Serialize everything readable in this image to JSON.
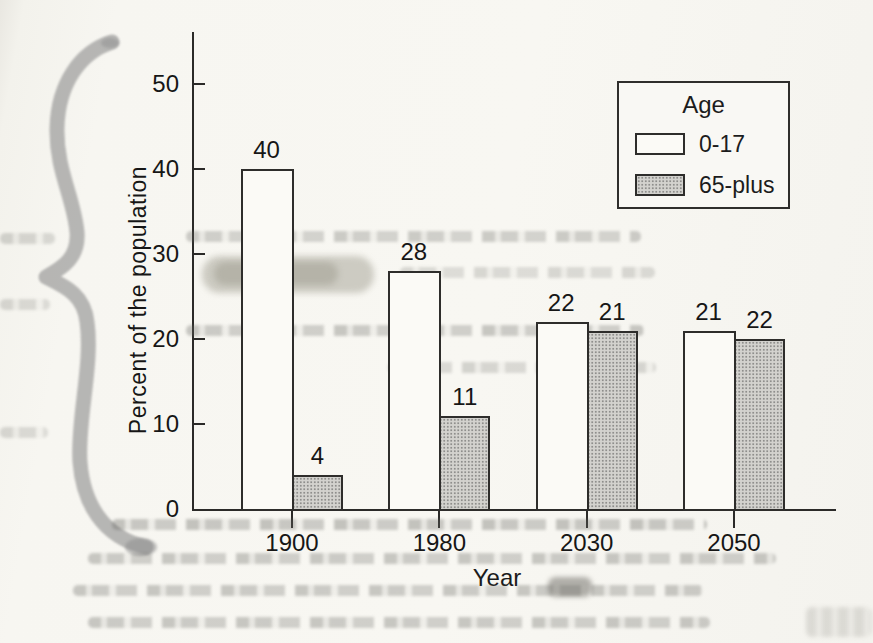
{
  "chart_data": {
    "type": "bar",
    "title": "",
    "categories": [
      "1900",
      "1980",
      "2030",
      "2050"
    ],
    "series": [
      {
        "name": "0-17",
        "fill": "white",
        "values": [
          40,
          28,
          22,
          21
        ],
        "drawn": [
          40,
          28,
          22,
          21
        ]
      },
      {
        "name": "65-plus",
        "fill": "halftone-gray",
        "values": [
          4,
          11,
          21,
          22
        ],
        "drawn": [
          4,
          11,
          21,
          20
        ]
      }
    ],
    "xlabel": "Year",
    "ylabel": "Percent of the population",
    "yticks": [
      0,
      10,
      20,
      30,
      40,
      50
    ],
    "ylim": [
      0,
      56
    ],
    "grid": false,
    "bar_value_labels_shown": true,
    "legend_title": "Age",
    "legend_position": "upper right",
    "colors": {
      "bar_white": "#fbfaf6",
      "bar_gray": "#c6c5c1",
      "ink": "#2b2a28",
      "paper": "#f7f6f1",
      "highlighter_gray": "#8f8f8f",
      "smudge_khaki": "#92907f"
    },
    "annotations": {
      "note": "scanned textbook figure; 2050 65-plus bar drawn at ~20 but labeled 22"
    }
  }
}
